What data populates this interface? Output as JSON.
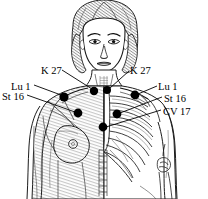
{
  "figure": {
    "background_color": "#ffffff",
    "ink_color": "#000000",
    "shade_color": "#9a9a9a",
    "labels": [
      {
        "id": "k27-left",
        "text": "K 27",
        "x": 41,
        "y": 66,
        "align": "left"
      },
      {
        "id": "k27-right",
        "text": "K 27",
        "x": 130,
        "y": 66,
        "align": "left"
      },
      {
        "id": "lu1-left",
        "text": "Lu 1",
        "x": 11,
        "y": 82,
        "align": "left"
      },
      {
        "id": "st16-left",
        "text": "St 16",
        "x": 2,
        "y": 92,
        "align": "left"
      },
      {
        "id": "lu1-right",
        "text": "Lu 1",
        "x": 158,
        "y": 82,
        "align": "left"
      },
      {
        "id": "st16-right",
        "text": "St 16",
        "x": 164,
        "y": 94,
        "align": "left"
      },
      {
        "id": "cv17-right",
        "text": "CV 17",
        "x": 163,
        "y": 107,
        "align": "left"
      }
    ],
    "points": [
      {
        "id": "lu1-left-dot",
        "name": "Lu 1",
        "x": 64,
        "y": 97,
        "r": 4.6
      },
      {
        "id": "k27-left-dot",
        "name": "K 27",
        "x": 94,
        "y": 91,
        "r": 4.2
      },
      {
        "id": "k27-right-dot",
        "name": "K 27",
        "x": 107,
        "y": 90,
        "r": 4.0
      },
      {
        "id": "lu1-right-dot",
        "name": "Lu 1",
        "x": 135,
        "y": 95,
        "r": 4.4
      },
      {
        "id": "st16-left-dot",
        "name": "St 16",
        "x": 78,
        "y": 113,
        "r": 4.4
      },
      {
        "id": "st16-right-dot",
        "name": "St 16",
        "x": 117,
        "y": 114,
        "r": 4.4
      },
      {
        "id": "cv17-dot",
        "name": "CV 17",
        "x": 103,
        "y": 127,
        "r": 4.4
      }
    ],
    "leader_lines": [
      {
        "id": "leader-k27-left",
        "from": [
          62,
          70
        ],
        "to": [
          92,
          89
        ]
      },
      {
        "id": "leader-k27-right",
        "from": [
          129,
          71
        ],
        "to": [
          110,
          88
        ]
      },
      {
        "id": "leader-lu1-left",
        "from": [
          34,
          85
        ],
        "to": [
          61,
          95
        ]
      },
      {
        "id": "leader-st16-left",
        "from": [
          27,
          95
        ],
        "to": [
          75,
          112
        ]
      },
      {
        "id": "leader-lu1-right",
        "from": [
          157,
          86
        ],
        "to": [
          138,
          94
        ]
      },
      {
        "id": "leader-st16-right",
        "from": [
          162,
          97
        ],
        "to": [
          120,
          113
        ]
      },
      {
        "id": "leader-cv17",
        "from": [
          161,
          110
        ],
        "to": [
          106,
          127
        ]
      }
    ]
  }
}
